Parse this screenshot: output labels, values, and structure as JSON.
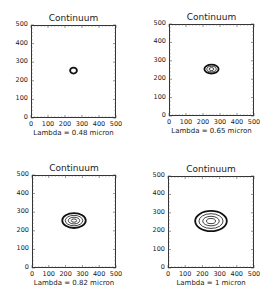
{
  "chart_data": [
    {
      "type": "contour",
      "title": "Continuum",
      "xlabel": "Lambda = 0.48 micron",
      "ylabel": "",
      "xlim": [
        0,
        500
      ],
      "ylim": [
        0,
        500
      ],
      "xticks": [
        "0",
        "100",
        "200",
        "300",
        "400",
        "500"
      ],
      "yticks": [
        "0",
        "100",
        "200",
        "300",
        "400",
        "500"
      ],
      "contours": [
        {
          "cx": 250,
          "cy": 255,
          "rx": 20,
          "ry": 16
        }
      ]
    },
    {
      "type": "contour",
      "title": "Continuum",
      "xlabel": "Lambda = 0.65 micron",
      "ylabel": "",
      "xlim": [
        0,
        500
      ],
      "ylim": [
        0,
        500
      ],
      "xticks": [
        "0",
        "100",
        "200",
        "300",
        "400",
        "500"
      ],
      "yticks": [
        "0",
        "100",
        "200",
        "300",
        "400",
        "500"
      ],
      "contours": [
        {
          "cx": 250,
          "cy": 255,
          "rx": 42,
          "ry": 24
        },
        {
          "cx": 250,
          "cy": 255,
          "rx": 28,
          "ry": 15
        },
        {
          "cx": 250,
          "cy": 255,
          "rx": 14,
          "ry": 8
        }
      ]
    },
    {
      "type": "contour",
      "title": "Continuum",
      "xlabel": "Lambda = 0.82 micron",
      "ylabel": "",
      "xlim": [
        0,
        500
      ],
      "ylim": [
        0,
        500
      ],
      "xticks": [
        "0",
        "100",
        "200",
        "300",
        "400",
        "500"
      ],
      "yticks": [
        "0",
        "100",
        "200",
        "300",
        "400",
        "500"
      ],
      "contours": [
        {
          "cx": 250,
          "cy": 255,
          "rx": 70,
          "ry": 40
        },
        {
          "cx": 250,
          "cy": 255,
          "rx": 52,
          "ry": 28
        },
        {
          "cx": 250,
          "cy": 255,
          "rx": 34,
          "ry": 18
        },
        {
          "cx": 250,
          "cy": 255,
          "rx": 16,
          "ry": 9
        }
      ]
    },
    {
      "type": "contour",
      "title": "Continuum",
      "xlabel": "Lambda = 1 micron",
      "ylabel": "",
      "xlim": [
        0,
        500
      ],
      "ylim": [
        0,
        500
      ],
      "xticks": [
        "0",
        "100",
        "200",
        "300",
        "400",
        "500"
      ],
      "yticks": [
        "0",
        "100",
        "200",
        "300",
        "400",
        "500"
      ],
      "contours": [
        {
          "cx": 250,
          "cy": 255,
          "rx": 92,
          "ry": 55
        },
        {
          "cx": 250,
          "cy": 255,
          "rx": 70,
          "ry": 40
        },
        {
          "cx": 250,
          "cy": 255,
          "rx": 48,
          "ry": 26
        },
        {
          "cx": 250,
          "cy": 255,
          "rx": 26,
          "ry": 14
        }
      ]
    }
  ]
}
